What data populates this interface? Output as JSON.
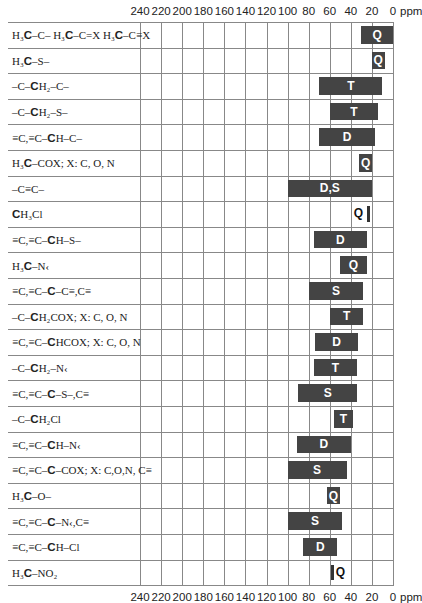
{
  "chart_data": {
    "type": "bar",
    "title": "",
    "xlabel": "ppm",
    "ylabel": "",
    "xlim": [
      240,
      0
    ],
    "x_ticks": [
      "240",
      "220",
      "200",
      "180",
      "160",
      "140",
      "120",
      "100",
      "80",
      "60",
      "40",
      "20",
      "0"
    ],
    "x_unit": "ppm",
    "grid": true,
    "orientation": "horizontal-range",
    "series": [
      {
        "label": "H3C-C-  H3C-C=X  H3C-C≡X",
        "from": 30,
        "to": 0,
        "multiplicity": "Q"
      },
      {
        "label": "H3C-S-",
        "from": 20,
        "to": 8,
        "multiplicity": "Q"
      },
      {
        "label": "-C-CH2-C-",
        "from": 70,
        "to": 10,
        "multiplicity": "T"
      },
      {
        "label": "-C-CH2-S-",
        "from": 60,
        "to": 14,
        "multiplicity": "T"
      },
      {
        "label": "≡C,≡C-CH-C-",
        "from": 70,
        "to": 17,
        "multiplicity": "D"
      },
      {
        "label": "H3C-COX; X: C, O, N",
        "from": 32,
        "to": 20,
        "multiplicity": "Q"
      },
      {
        "label": "-C≡C-",
        "from": 100,
        "to": 20,
        "multiplicity": "D,S"
      },
      {
        "label": "CH3Cl",
        "from": 24,
        "to": 24,
        "multiplicity": "Q"
      },
      {
        "label": "≡C,≡C-CH-S-",
        "from": 75,
        "to": 25,
        "multiplicity": "D"
      },
      {
        "label": "H3C-N<",
        "from": 50,
        "to": 25,
        "multiplicity": "Q"
      },
      {
        "label": "≡C,≡C-C-C≡,C≡",
        "from": 80,
        "to": 28,
        "multiplicity": "S"
      },
      {
        "label": "-C-CH2COX; X: C, O, N",
        "from": 60,
        "to": 28,
        "multiplicity": "T"
      },
      {
        "label": "≡C,≡C-CHCOX; X: C, O, N",
        "from": 74,
        "to": 33,
        "multiplicity": "D"
      },
      {
        "label": "-C-CH2-N<",
        "from": 75,
        "to": 34,
        "multiplicity": "T"
      },
      {
        "label": "≡C,≡C-C-S-,C≡",
        "from": 90,
        "to": 34,
        "multiplicity": "S"
      },
      {
        "label": "-C-CH2Cl",
        "from": 56,
        "to": 38,
        "multiplicity": "T"
      },
      {
        "label": "≡C,≡C-CH-N<",
        "from": 91,
        "to": 40,
        "multiplicity": "D"
      },
      {
        "label": "≡C,≡C-C-COX; X: C,O,N,C≡",
        "from": 100,
        "to": 44,
        "multiplicity": "S"
      },
      {
        "label": "H3C-O-",
        "from": 63,
        "to": 50,
        "multiplicity": "Q"
      },
      {
        "label": "≡C,≡C-C-N<,C≡",
        "from": 100,
        "to": 48,
        "multiplicity": "S"
      },
      {
        "label": "≡C,≡C-CH-Cl",
        "from": 85,
        "to": 53,
        "multiplicity": "D"
      },
      {
        "label": "H3C-NO2",
        "from": 58,
        "to": 58,
        "multiplicity": "Q"
      }
    ]
  },
  "axis": {
    "ticks": [
      "240",
      "220",
      "200",
      "180",
      "160",
      "140",
      "120",
      "100",
      "80",
      "60",
      "40",
      "20",
      "0"
    ],
    "unit": "ppm"
  },
  "rows": [
    {
      "parts": [
        [
          "H₃",
          0
        ],
        [
          "C",
          1
        ],
        [
          "–C–  H₃",
          0
        ],
        [
          "C",
          1
        ],
        [
          "–C=X  H₃",
          0
        ],
        [
          "C",
          1
        ],
        [
          "–C≡X",
          0
        ]
      ],
      "label": "H3C-C-  H3C-C=X  H3C-C≡X",
      "bar": "Q"
    },
    {
      "parts": [
        [
          "H₃",
          0
        ],
        [
          "C",
          1
        ],
        [
          "–S–",
          0
        ]
      ],
      "label": "H3C-S-",
      "bar": "Q"
    },
    {
      "parts": [
        [
          "–C–",
          0
        ],
        [
          "C",
          1
        ],
        [
          "H₂–C–",
          0
        ]
      ],
      "label": "-C-CH2-C-",
      "bar": "T"
    },
    {
      "parts": [
        [
          "–C–",
          0
        ],
        [
          "C",
          1
        ],
        [
          "H₂–S–",
          0
        ]
      ],
      "label": "-C-CH2-S-",
      "bar": "T"
    },
    {
      "parts": [
        [
          "≡C,≡C–",
          0
        ],
        [
          "C",
          1
        ],
        [
          "H–C–",
          0
        ]
      ],
      "label": "≡C,≡C-CH-C-",
      "bar": "D"
    },
    {
      "parts": [
        [
          "H₃",
          0
        ],
        [
          "C",
          1
        ],
        [
          "–COX; X: C, O, N",
          0
        ]
      ],
      "label": "H3C-COX; X: C, O, N",
      "bar": "Q"
    },
    {
      "parts": [
        [
          "–C≡C–",
          0
        ]
      ],
      "label": "-C≡C-",
      "bar": "D,S"
    },
    {
      "parts": [
        [
          "C",
          1
        ],
        [
          "H₃Cl",
          0
        ]
      ],
      "label": "CH3Cl",
      "bar": "Q"
    },
    {
      "parts": [
        [
          "≡C,≡C–",
          0
        ],
        [
          "C",
          1
        ],
        [
          "H–S–",
          0
        ]
      ],
      "label": "≡C,≡C-CH-S-",
      "bar": "D"
    },
    {
      "parts": [
        [
          "H₃",
          0
        ],
        [
          "C",
          1
        ],
        [
          "–N‹",
          0
        ]
      ],
      "label": "H3C-N<",
      "bar": "Q"
    },
    {
      "parts": [
        [
          "≡C,≡C–",
          0
        ],
        [
          "C",
          1
        ],
        [
          "–C≡,C≡",
          0
        ]
      ],
      "label": "≡C,≡C-C-C≡,C≡",
      "bar": "S"
    },
    {
      "parts": [
        [
          "–C–",
          0
        ],
        [
          "C",
          1
        ],
        [
          "H₂COX; X: C, O, N",
          0
        ]
      ],
      "label": "-C-CH2COX; X: C, O, N",
      "bar": "T"
    },
    {
      "parts": [
        [
          "≡C,≡C–",
          0
        ],
        [
          "C",
          1
        ],
        [
          "HCOX; X: C, O, N",
          0
        ]
      ],
      "label": "≡C,≡C-CHCOX; X: C, O, N",
      "bar": "D"
    },
    {
      "parts": [
        [
          "–C–",
          0
        ],
        [
          "C",
          1
        ],
        [
          "H₂–N‹",
          0
        ]
      ],
      "label": "-C-CH2-N<",
      "bar": "T"
    },
    {
      "parts": [
        [
          "≡C,≡C–",
          0
        ],
        [
          "C",
          1
        ],
        [
          "–S–,C≡",
          0
        ]
      ],
      "label": "≡C,≡C-C-S-,C≡",
      "bar": "S"
    },
    {
      "parts": [
        [
          "–C–",
          0
        ],
        [
          "C",
          1
        ],
        [
          "H₂Cl",
          0
        ]
      ],
      "label": "-C-CH2Cl",
      "bar": "T"
    },
    {
      "parts": [
        [
          "≡C,≡C–",
          0
        ],
        [
          "C",
          1
        ],
        [
          "H–N‹",
          0
        ]
      ],
      "label": "≡C,≡C-CH-N<",
      "bar": "D"
    },
    {
      "parts": [
        [
          "≡C,≡C–",
          0
        ],
        [
          "C",
          1
        ],
        [
          "–COX; X: C,O,N, C≡",
          0
        ]
      ],
      "label": "≡C,≡C-C-COX; X: C,O,N,C≡",
      "bar": "S"
    },
    {
      "parts": [
        [
          "H₃",
          0
        ],
        [
          "C",
          1
        ],
        [
          "–O–",
          0
        ]
      ],
      "label": "H3C-O-",
      "bar": "Q"
    },
    {
      "parts": [
        [
          "≡C,≡C–",
          0
        ],
        [
          "C",
          1
        ],
        [
          "–N‹,C≡",
          0
        ]
      ],
      "label": "≡C,≡C-C-N<,C≡",
      "bar": "S"
    },
    {
      "parts": [
        [
          "≡C,≡C–",
          0
        ],
        [
          "C",
          1
        ],
        [
          "H–Cl",
          0
        ]
      ],
      "label": "≡C,≡C-CH-Cl",
      "bar": "D"
    },
    {
      "parts": [
        [
          "H₃",
          0
        ],
        [
          "C",
          1
        ],
        [
          "–NO₂",
          0
        ]
      ],
      "label": "H3C-NO2",
      "bar": "Q"
    }
  ],
  "colors": {
    "bar": "#444444",
    "grid": "#888888",
    "text": "#222222"
  }
}
